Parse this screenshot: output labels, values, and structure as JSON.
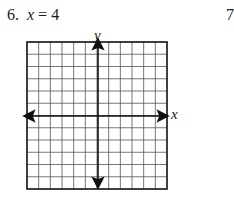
{
  "problem": {
    "number": "6.",
    "equation_var": "x",
    "equation_rest": " = 4",
    "next_number": "7"
  },
  "graph": {
    "x_axis_label": "x",
    "y_axis_label": "y",
    "columns": 12,
    "rows": 12,
    "grid_color": "#555555",
    "axis_color": "#111111"
  }
}
